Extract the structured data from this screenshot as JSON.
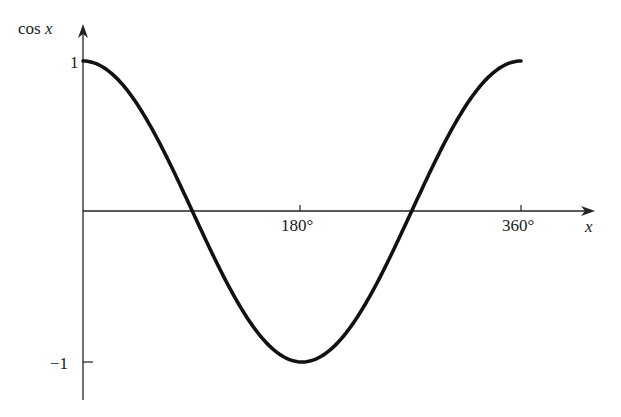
{
  "chart_data": {
    "type": "line",
    "title": "",
    "xlabel": "x",
    "ylabel": "cos x",
    "x_ticks": [
      "180°",
      "360°"
    ],
    "y_ticks": [
      "1",
      "−1"
    ],
    "xlim": [
      0,
      360
    ],
    "ylim": [
      -1,
      1
    ],
    "grid": false,
    "legend": null,
    "series": [
      {
        "name": "cos x",
        "x": [
          0,
          30,
          60,
          90,
          120,
          150,
          180,
          210,
          240,
          270,
          300,
          330,
          360
        ],
        "y": [
          1,
          0.866,
          0.5,
          0,
          -0.5,
          -0.866,
          -1,
          -0.866,
          -0.5,
          0,
          0.5,
          0.866,
          1
        ]
      }
    ]
  },
  "labels": {
    "y_axis": "cos",
    "y_axis_var": "x",
    "x_axis": "x",
    "tick_180": "180°",
    "tick_360": "360°",
    "tick_pos1": "1",
    "tick_neg1": "−1"
  }
}
